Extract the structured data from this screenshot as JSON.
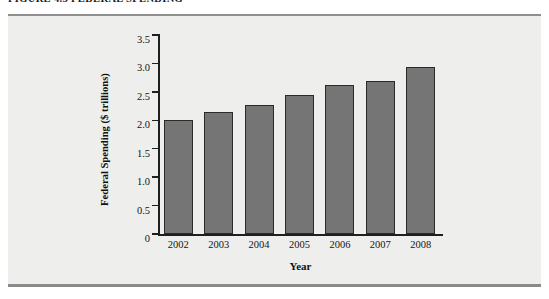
{
  "figure": {
    "caption": "FIGURE 4.3   FEDERAL SPENDING"
  },
  "colors": {
    "bar_fill": "#757575",
    "bar_border": "#2a2a2a",
    "panel_background": "#eeeeec",
    "axis": "#1f1f1f",
    "frame_border": "#8a8a8a",
    "page_background": "#ffffff"
  },
  "chart_data": {
    "type": "bar",
    "title": "FIGURE 4.3   FEDERAL SPENDING",
    "xlabel": "Year",
    "ylabel": "Federal Spending ($ trillions)",
    "categories": [
      "2002",
      "2003",
      "2004",
      "2005",
      "2006",
      "2007",
      "2008"
    ],
    "values": [
      2.0,
      2.15,
      2.27,
      2.45,
      2.62,
      2.7,
      2.93
    ],
    "ylim": [
      0,
      3.5
    ],
    "ytick_values": [
      0,
      0.5,
      1.0,
      1.5,
      2.0,
      2.5,
      3.0,
      3.5
    ],
    "ytick_labels": [
      "0",
      "0.5",
      "1.0",
      "1.5",
      "2.0",
      "2.5",
      "3.0",
      "3.5"
    ],
    "grid": false,
    "legend": null,
    "legend_position": "none",
    "series": [
      {
        "name": "Federal Spending",
        "values": [
          2.0,
          2.15,
          2.27,
          2.45,
          2.62,
          2.7,
          2.93
        ]
      }
    ]
  }
}
